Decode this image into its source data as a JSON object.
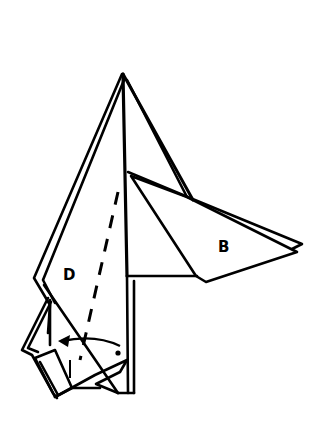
{
  "diagram": {
    "type": "origami-instruction",
    "labels": [
      {
        "id": "flap-b",
        "text": "B",
        "x": 218,
        "y": 240
      },
      {
        "id": "flap-d",
        "text": "D",
        "x": 63,
        "y": 268
      }
    ],
    "annotations": {
      "fold_line": "valley fold (dashed)",
      "arrow": "fold direction arrow, curving left",
      "dot": "reference point"
    },
    "colors": {
      "ink": "#000000",
      "paper": "#ffffff"
    }
  }
}
